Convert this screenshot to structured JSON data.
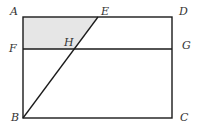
{
  "diagram": {
    "type": "geometry",
    "shape": "rectangle ABCD with segment BE and line FG",
    "colors": {
      "stroke": "#1a1a1a",
      "shaded_fill": "#e6e6e6",
      "label": "#333333"
    },
    "points": {
      "A": {
        "label": "A",
        "x": 23,
        "y": 17
      },
      "D": {
        "label": "D",
        "x": 172,
        "y": 17
      },
      "B": {
        "label": "B",
        "x": 23,
        "y": 118
      },
      "C": {
        "label": "C",
        "x": 172,
        "y": 118
      },
      "E": {
        "label": "E",
        "x": 98,
        "y": 17
      },
      "F": {
        "label": "F",
        "x": 23,
        "y": 49
      },
      "G": {
        "label": "G",
        "x": 172,
        "y": 49
      },
      "H": {
        "label": "H",
        "x": 75,
        "y": 49
      }
    },
    "segments": [
      "AD",
      "DC",
      "CB",
      "BA",
      "FG",
      "BE"
    ],
    "shaded_region": [
      "A",
      "E",
      "H",
      "F"
    ]
  }
}
